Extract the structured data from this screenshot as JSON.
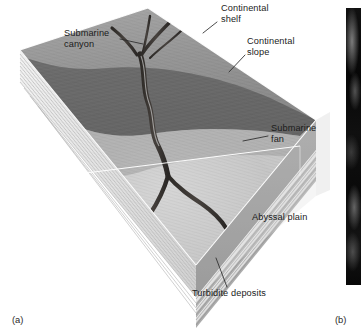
{
  "figure": {
    "panels": [
      {
        "tag": "(a)",
        "type": "block-diagram"
      },
      {
        "tag": "(b)",
        "type": "photograph"
      }
    ]
  },
  "diagram": {
    "labels": {
      "continental_shelf": "Continental\nshelf",
      "continental_slope": "Continental\nslope",
      "submarine_canyon": "Submarine\ncanyon",
      "submarine_fan": "Submarine\nfan",
      "abyssal_plain": "Abyssal plain",
      "turbidite_deposits": "Turbidite deposits"
    },
    "colors": {
      "shelf_surface": "#9a9a9a",
      "slope_surface": "#6e6e6e",
      "fan_surface": "#c8c8c8",
      "abyssal_band": "#8b8b8b",
      "turbidite_stripe_light": "#e4e4e4",
      "turbidite_stripe_dark": "#a9a9a9",
      "canyon_channel": "#3a3634",
      "glass_wall": "#d9d9d9",
      "edge_highlight": "#ffffff",
      "label_text": "#1b1b1b",
      "photo_background": "#0b0b0b"
    }
  }
}
